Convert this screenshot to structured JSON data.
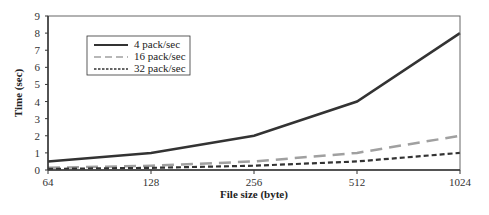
{
  "chart_data": {
    "type": "line",
    "title": "",
    "xlabel": "File size (byte)",
    "ylabel": "Time (sec)",
    "categories": [
      "64",
      "128",
      "256",
      "512",
      "1024"
    ],
    "ylim": [
      0,
      9
    ],
    "yticks": [
      "0",
      "1",
      "2",
      "3",
      "4",
      "5",
      "6",
      "7",
      "8",
      "9"
    ],
    "grid": false,
    "legend_position": "upper-left-inside",
    "series": [
      {
        "name": "4 pack/sec",
        "style": "solid",
        "color": "#333333",
        "values": [
          0.5,
          1.0,
          2.0,
          4.0,
          8.0
        ]
      },
      {
        "name": "16 pack/sec",
        "style": "long-dash",
        "color": "#a0a0a0",
        "values": [
          0.125,
          0.25,
          0.5,
          1.0,
          2.0
        ]
      },
      {
        "name": "32 pack/sec",
        "style": "short-dash",
        "color": "#333333",
        "values": [
          0.0625,
          0.125,
          0.25,
          0.5,
          1.0
        ]
      }
    ]
  }
}
